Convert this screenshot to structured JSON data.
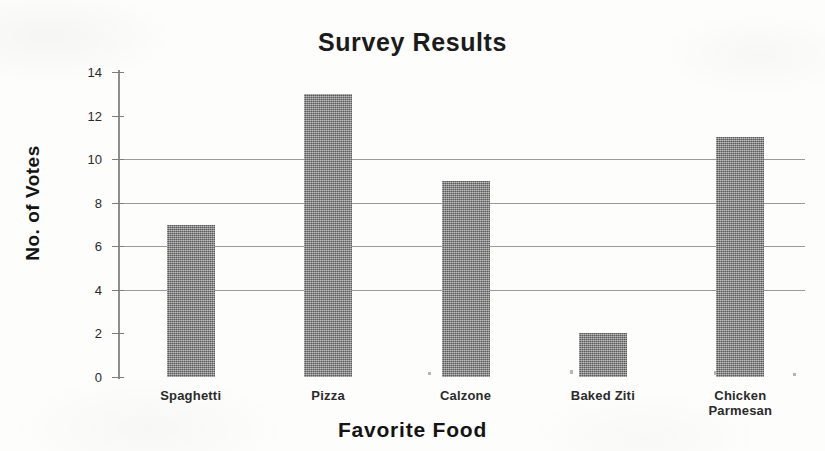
{
  "chart_data": {
    "type": "bar",
    "title": "Survey Results",
    "xlabel": "Favorite Food",
    "ylabel": "No. of Votes",
    "categories": [
      "Spaghetti",
      "Pizza",
      "Calzone",
      "Baked Ziti",
      "Chicken Parmesan"
    ],
    "category_lines": [
      [
        "Spaghetti"
      ],
      [
        "Pizza"
      ],
      [
        "Calzone"
      ],
      [
        "Baked Ziti"
      ],
      [
        "Chicken",
        "Parmesan"
      ]
    ],
    "values": [
      7,
      13,
      9,
      2,
      11
    ],
    "ylim": [
      0,
      14
    ],
    "ytick_labels": [
      "0",
      "2",
      "4",
      "6",
      "8",
      "10",
      "12",
      "14"
    ],
    "ytick_values": [
      0,
      2,
      4,
      6,
      8,
      10,
      12,
      14
    ],
    "gridline_values": [
      4,
      6,
      8,
      10
    ],
    "grid": true,
    "legend": "none",
    "bar_color": "#7e7e7e",
    "grid_color": "#9a9a9a",
    "axis_color": "#8e8e8e",
    "text_color": "#1b1b1b",
    "background_color": "#fdfdfc"
  }
}
